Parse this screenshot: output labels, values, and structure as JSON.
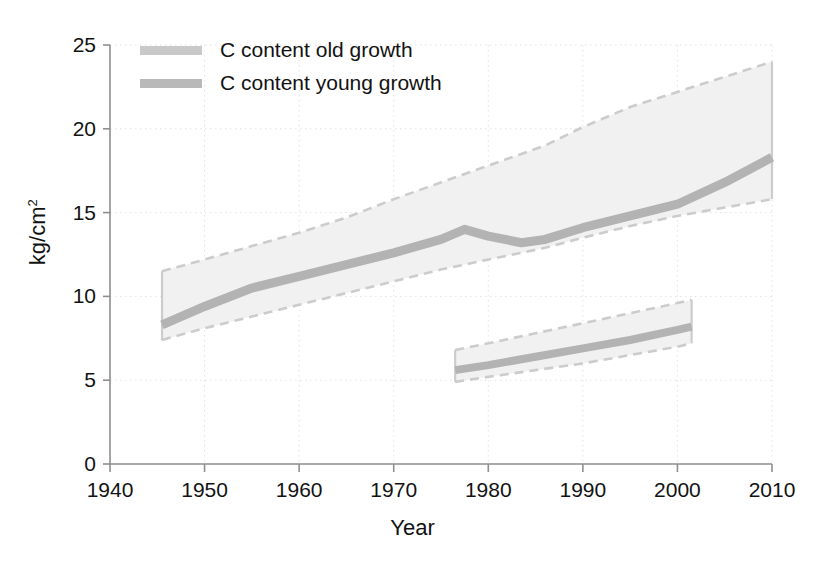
{
  "chart_data": {
    "type": "area",
    "title": "",
    "xlabel": "Year",
    "ylabel": "kg/cm2",
    "ylabel_base": "kg/cm",
    "ylabel_sup": "2",
    "xlim": [
      1940,
      2010
    ],
    "ylim": [
      0,
      25
    ],
    "xticks": [
      1940,
      1950,
      1960,
      1970,
      1980,
      1990,
      2000,
      2010
    ],
    "yticks": [
      0,
      5,
      10,
      15,
      20,
      25
    ],
    "grid": true,
    "grid_style": "dotted",
    "legend_position": "upper left",
    "legend": [
      {
        "label": "C content old growth",
        "swatch_color": "#c9c9c9",
        "icon": "line-swatch"
      },
      {
        "label": "C content young growth",
        "swatch_color": "#b9b9b9",
        "icon": "line-swatch"
      }
    ],
    "series": [
      {
        "name": "C content old growth",
        "kind": "line-with-band",
        "line_color": "#b3b3b3",
        "band_fill": "#f1f1f1",
        "band_edge_color": "#cccccc",
        "band_edge_style": "dashed",
        "x": [
          1945.5,
          1950,
          1955,
          1960,
          1965,
          1970,
          1975,
          1977.5,
          1980,
          1983.5,
          1986,
          1990,
          1995,
          2000,
          2005,
          2010
        ],
        "y": [
          8.3,
          9.4,
          10.5,
          11.2,
          11.9,
          12.6,
          13.4,
          14.0,
          13.6,
          13.2,
          13.4,
          14.1,
          14.8,
          15.5,
          16.8,
          18.3
        ],
        "y_upper": [
          11.5,
          12.2,
          13.0,
          13.8,
          14.7,
          15.8,
          16.8,
          17.3,
          17.8,
          18.5,
          19.0,
          20.1,
          21.3,
          22.2,
          23.1,
          24.0
        ],
        "y_lower": [
          7.4,
          8.1,
          8.8,
          9.5,
          10.2,
          10.9,
          11.6,
          11.9,
          12.2,
          12.6,
          12.9,
          13.5,
          14.2,
          14.8,
          15.3,
          15.8
        ]
      },
      {
        "name": "C content young growth",
        "kind": "line-with-band",
        "line_color": "#b3b3b3",
        "band_fill": "#f1f1f1",
        "band_edge_color": "#cccccc",
        "band_edge_style": "dashed",
        "x": [
          1976.5,
          1980,
          1985,
          1990,
          1995,
          2000,
          2001.5
        ],
        "y": [
          5.6,
          5.9,
          6.4,
          6.9,
          7.4,
          8.0,
          8.2
        ],
        "y_upper": [
          6.8,
          7.2,
          7.8,
          8.4,
          9.0,
          9.6,
          9.8
        ],
        "y_lower": [
          4.9,
          5.2,
          5.6,
          6.0,
          6.5,
          7.0,
          7.2
        ],
        "band_x_end": 2003
      }
    ]
  },
  "axes": {
    "x_tick_labels": [
      "1940",
      "1950",
      "1960",
      "1970",
      "1980",
      "1990",
      "2000",
      "2010"
    ],
    "y_tick_labels": [
      "0",
      "5",
      "10",
      "15",
      "20",
      "25"
    ],
    "xlabel": "Year",
    "ylabel_base": "kg/cm",
    "ylabel_sup": "2"
  },
  "legend": {
    "items": [
      {
        "label": "C content old growth"
      },
      {
        "label": "C content young growth"
      }
    ]
  }
}
